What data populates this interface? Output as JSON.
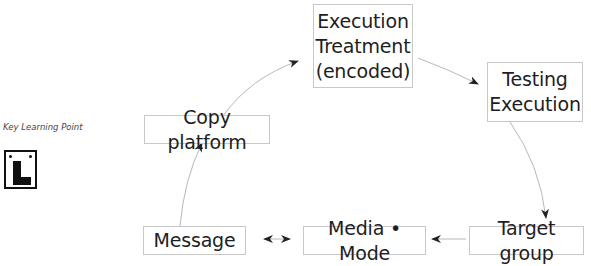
{
  "key_learning_point": {
    "label": "Key Learning Point",
    "icon": "learner-L-plate-icon"
  },
  "nodes": {
    "execution_treatment": {
      "lines": [
        "Execution",
        "Treatment",
        "(encoded)"
      ]
    },
    "testing_execution": {
      "lines": [
        "Testing",
        "Execution"
      ]
    },
    "copy_platform": {
      "label": "Copy platform"
    },
    "message": {
      "label": "Message"
    },
    "media_mode": {
      "label": "Media • Mode"
    },
    "target_group": {
      "label": "Target group"
    }
  },
  "edges": [
    {
      "from": "copy_platform",
      "to": "execution_treatment",
      "type": "curved-arrow"
    },
    {
      "from": "execution_treatment",
      "to": "testing_execution",
      "type": "curved-arrow"
    },
    {
      "from": "testing_execution",
      "to": "target_group",
      "type": "curved-arrow"
    },
    {
      "from": "target_group",
      "to": "media_mode",
      "type": "arrow"
    },
    {
      "from": "media_mode",
      "to": "message",
      "type": "double-arrow"
    },
    {
      "from": "message",
      "to": "copy_platform",
      "type": "curved-arrow"
    }
  ],
  "colors": {
    "box_border": "#c8c8c8",
    "line": "#b0b0b0",
    "arrowhead": "#222222",
    "text": "#1e1e1e"
  }
}
